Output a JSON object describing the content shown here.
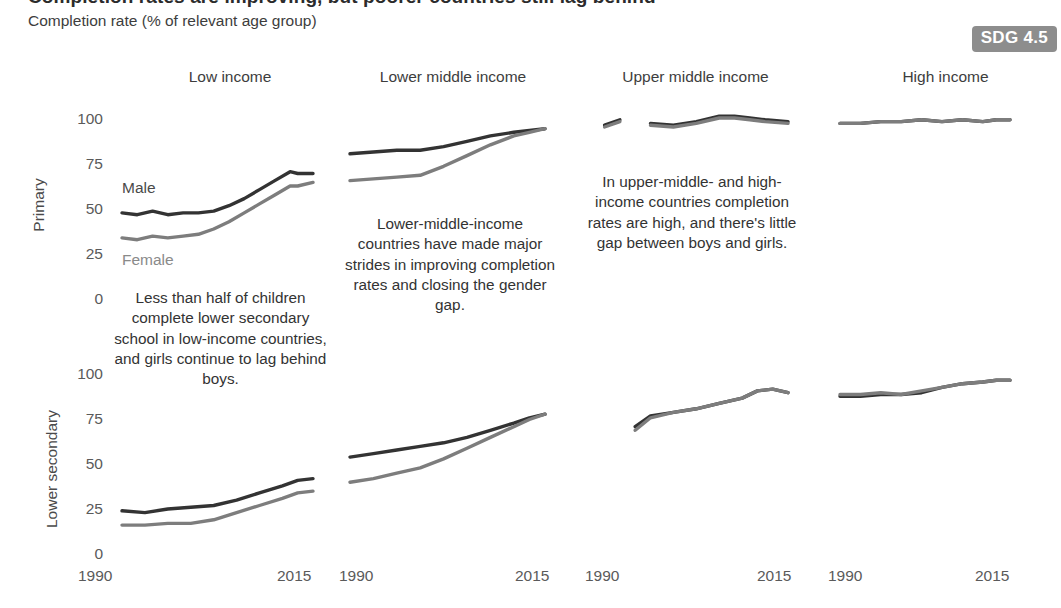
{
  "header": {
    "title": "Completion rates are improving, but poorer countries still lag behind",
    "subtitle": "Completion rate (% of relevant age group)",
    "badge": "SDG 4.5"
  },
  "row_labels": {
    "primary": "Primary",
    "lower_secondary": "Lower secondary"
  },
  "series_labels": {
    "male": "Male",
    "female": "Female"
  },
  "colors": {
    "male": "#333333",
    "female": "#7d7d7d",
    "badge_bg": "#8d8d8d",
    "badge_text": "#ffffff",
    "background": "#ffffff",
    "tick_text": "#5a5a5a"
  },
  "annotations": [
    {
      "id": "low-income-note",
      "text": "Less than half of children complete lower secondary school in low-income countries, and girls continue to lag behind boys."
    },
    {
      "id": "lower-middle-note",
      "text": "Lower-middle-income countries have made major strides in improving completion rates and closing the gender gap."
    },
    {
      "id": "upper-middle-note",
      "text": "In upper-middle- and high- income countries completion rates are high, and there's little gap between boys and girls."
    }
  ],
  "chart_data": {
    "type": "line",
    "title": "Completion rates are improving, but poorer countries still lag behind",
    "subtitle": "Completion rate (% of relevant age group)",
    "ylabel": "Completion rate (% of relevant age group)",
    "xlabel": "",
    "xlim": [
      1990,
      2015
    ],
    "ylim": [
      0,
      100
    ],
    "yticks": [
      0,
      25,
      50,
      75,
      100
    ],
    "xticks": [
      1990,
      2015
    ],
    "xtick_labels": [
      "1990",
      "2015"
    ],
    "ytick_labels": [
      "0",
      "25",
      "50",
      "75",
      "100"
    ],
    "grid": false,
    "legend": "inline-annotations",
    "rows": [
      "Primary",
      "Lower secondary"
    ],
    "columns": [
      "Low income",
      "Lower middle income",
      "Upper middle income",
      "High income"
    ],
    "panels": [
      {
        "row": "Primary",
        "column": "Low income",
        "series": [
          {
            "name": "Male",
            "color": "#333333",
            "x": [
              1990,
              1992,
              1994,
              1996,
              1998,
              2000,
              2002,
              2004,
              2006,
              2008,
              2010,
              2012,
              2013,
              2015
            ],
            "values": [
              47,
              46,
              48,
              46,
              47,
              47,
              48,
              51,
              55,
              60,
              65,
              70,
              69,
              69
            ]
          },
          {
            "name": "Female",
            "color": "#7d7d7d",
            "x": [
              1990,
              1992,
              1994,
              1996,
              1998,
              2000,
              2002,
              2004,
              2006,
              2008,
              2010,
              2012,
              2013,
              2015
            ],
            "values": [
              33,
              32,
              34,
              33,
              34,
              35,
              38,
              42,
              47,
              52,
              57,
              62,
              62,
              64
            ]
          }
        ]
      },
      {
        "row": "Primary",
        "column": "Lower middle income",
        "series": [
          {
            "name": "Male",
            "color": "#333333",
            "x": [
              1990,
              1993,
              1996,
              1999,
              2002,
              2005,
              2008,
              2011,
              2013,
              2015
            ],
            "values": [
              80,
              81,
              82,
              82,
              84,
              87,
              90,
              92,
              93,
              94
            ]
          },
          {
            "name": "Female",
            "color": "#7d7d7d",
            "x": [
              1990,
              1993,
              1996,
              1999,
              2002,
              2005,
              2008,
              2011,
              2013,
              2015
            ],
            "values": [
              65,
              66,
              67,
              68,
              73,
              79,
              85,
              90,
              92,
              94
            ]
          }
        ]
      },
      {
        "row": "Primary",
        "column": "Upper middle income",
        "series": [
          {
            "name": "Male",
            "color": "#333333",
            "segments": [
              {
                "x": [
                  1991,
                  1993
                ],
                "values": [
                  96,
                  99
                ]
              },
              {
                "x": [
                  1997,
                  2000,
                  2003,
                  2006,
                  2008,
                  2010,
                  2012,
                  2015
                ],
                "values": [
                  97,
                  96,
                  98,
                  101,
                  101,
                  100,
                  99,
                  98
                ]
              }
            ]
          },
          {
            "name": "Female",
            "color": "#7d7d7d",
            "segments": [
              {
                "x": [
                  1991,
                  1993
                ],
                "values": [
                  95,
                  98
                ]
              },
              {
                "x": [
                  1997,
                  2000,
                  2003,
                  2006,
                  2008,
                  2010,
                  2012,
                  2015
                ],
                "values": [
                  96,
                  95,
                  97,
                  100,
                  100,
                  99,
                  98,
                  97
                ]
              }
            ]
          }
        ]
      },
      {
        "row": "Primary",
        "column": "High income",
        "series": [
          {
            "name": "Male",
            "color": "#333333",
            "x": [
              1990,
              1993,
              1996,
              1999,
              2002,
              2005,
              2008,
              2011,
              2013,
              2015
            ],
            "values": [
              97,
              97,
              98,
              98,
              99,
              98,
              99,
              98,
              99,
              99
            ]
          },
          {
            "name": "Female",
            "color": "#7d7d7d",
            "x": [
              1990,
              1993,
              1996,
              1999,
              2002,
              2005,
              2008,
              2011,
              2013,
              2015
            ],
            "values": [
              97,
              97,
              98,
              98,
              99,
              98,
              99,
              98,
              99,
              99
            ]
          }
        ]
      },
      {
        "row": "Lower secondary",
        "column": "Low income",
        "series": [
          {
            "name": "Male",
            "color": "#333333",
            "x": [
              1990,
              1993,
              1996,
              1999,
              2002,
              2005,
              2008,
              2011,
              2013,
              2015
            ],
            "values": [
              23,
              22,
              24,
              25,
              26,
              29,
              33,
              37,
              40,
              41
            ]
          },
          {
            "name": "Female",
            "color": "#7d7d7d",
            "x": [
              1990,
              1993,
              1996,
              1999,
              2002,
              2005,
              2008,
              2011,
              2013,
              2015
            ],
            "values": [
              15,
              15,
              16,
              16,
              18,
              22,
              26,
              30,
              33,
              34
            ]
          }
        ]
      },
      {
        "row": "Lower secondary",
        "column": "Lower middle income",
        "series": [
          {
            "name": "Male",
            "color": "#333333",
            "x": [
              1990,
              1993,
              1996,
              1999,
              2002,
              2005,
              2008,
              2011,
              2013,
              2015
            ],
            "values": [
              53,
              55,
              57,
              59,
              61,
              64,
              68,
              72,
              75,
              77
            ]
          },
          {
            "name": "Female",
            "color": "#7d7d7d",
            "x": [
              1990,
              1993,
              1996,
              1999,
              2002,
              2005,
              2008,
              2011,
              2013,
              2015
            ],
            "values": [
              39,
              41,
              44,
              47,
              52,
              58,
              64,
              70,
              74,
              77
            ]
          }
        ]
      },
      {
        "row": "Lower secondary",
        "column": "Upper middle income",
        "series": [
          {
            "name": "Male",
            "color": "#333333",
            "x": [
              1995,
              1997,
              2000,
              2003,
              2006,
              2009,
              2011,
              2013,
              2015
            ],
            "values": [
              70,
              76,
              78,
              80,
              83,
              86,
              90,
              91,
              89
            ]
          },
          {
            "name": "Female",
            "color": "#7d7d7d",
            "x": [
              1995,
              1997,
              2000,
              2003,
              2006,
              2009,
              2011,
              2013,
              2015
            ],
            "values": [
              68,
              75,
              78,
              80,
              83,
              86,
              90,
              91,
              89
            ]
          }
        ]
      },
      {
        "row": "Lower secondary",
        "column": "High income",
        "series": [
          {
            "name": "Male",
            "color": "#333333",
            "x": [
              1990,
              1993,
              1996,
              1999,
              2002,
              2005,
              2008,
              2011,
              2013,
              2015
            ],
            "values": [
              87,
              87,
              88,
              88,
              89,
              92,
              94,
              95,
              96,
              96
            ]
          },
          {
            "name": "Female",
            "color": "#7d7d7d",
            "x": [
              1990,
              1993,
              1996,
              1999,
              2002,
              2005,
              2008,
              2011,
              2013,
              2015
            ],
            "values": [
              88,
              88,
              89,
              88,
              90,
              92,
              94,
              95,
              96,
              96
            ]
          }
        ]
      }
    ]
  },
  "axes": {
    "panel_x_ticks": [
      {
        "left": "1990",
        "right": "2015"
      },
      {
        "left": "1990",
        "right": "2015"
      },
      {
        "left": "1990",
        "right": "2015"
      },
      {
        "left": "1990",
        "right": "2015"
      }
    ]
  }
}
